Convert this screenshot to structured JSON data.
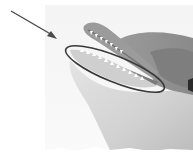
{
  "figure": {
    "annotation": {
      "type": "arrow-and-ellipse",
      "target": "lower jaw",
      "arrow_color": "#4a4a4a",
      "ellipse_color": "#3a3a3a"
    },
    "colors": {
      "background": "#ffffff",
      "panel": "#f5f5f5",
      "dolphin_dark": "#8c8c8c",
      "dolphin_mid": "#a9a9a9",
      "dolphin_light": "#dcdcdc",
      "mouth_inner": "#7a7a7a",
      "teeth": "#ffffff"
    }
  }
}
